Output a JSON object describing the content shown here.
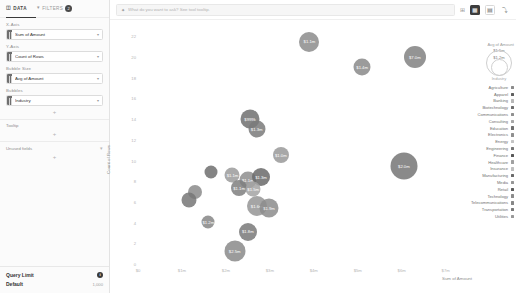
{
  "sidebar": {
    "tabs": [
      {
        "label": "DATA",
        "icon": "database-icon",
        "active": true,
        "badge": ""
      },
      {
        "label": "FILTERS",
        "icon": "funnel-icon",
        "active": false,
        "badge": "2"
      }
    ],
    "shelves": [
      {
        "label": "X-Axis",
        "field": "Sum of Amount",
        "caret": "▾"
      },
      {
        "label": "Y-Axis",
        "field": "Count of Rows",
        "caret": "▾"
      },
      {
        "label": "Bubble Size",
        "field": "Avg of Amount",
        "caret": "▾"
      },
      {
        "label": "Bubbles",
        "field": "Industry",
        "caret": "▾"
      }
    ],
    "add_label": "+",
    "sections": [
      {
        "label": "Tooltip",
        "icon": ""
      },
      {
        "label": "Unused fields",
        "icon": "▾"
      }
    ],
    "query_limit": {
      "title": "Query Limit",
      "info_icon": "i",
      "value": "Default",
      "count": "1,000"
    }
  },
  "topbar": {
    "prompt_icon": "sparkle-icon",
    "prompt_placeholder": "What do you want to ask? See tool tooltip.",
    "buttons": [
      {
        "name": "chart-type-button",
        "icon": "▦",
        "style": "filled"
      },
      {
        "name": "layout-button",
        "icon": "▤",
        "style": "bordered"
      },
      {
        "name": "more-button",
        "icon": "⤵",
        "style": "plain"
      }
    ],
    "settings_icon": "⊞"
  },
  "chart_data": {
    "type": "scatter",
    "title": "",
    "xlabel": "Sum of Amount",
    "ylabel": "Count of Rows",
    "xlim": [
      0,
      7600000
    ],
    "ylim": [
      0,
      23
    ],
    "xticks": [
      {
        "value": 0,
        "label": "$0"
      },
      {
        "value": 1000000,
        "label": "$1m"
      },
      {
        "value": 2000000,
        "label": "$2m"
      },
      {
        "value": 3000000,
        "label": "$3m"
      },
      {
        "value": 4000000,
        "label": "$4m"
      },
      {
        "value": 5000000,
        "label": "$5m"
      },
      {
        "value": 6000000,
        "label": "$6m"
      },
      {
        "value": 7000000,
        "label": "$7m"
      }
    ],
    "yticks": [
      {
        "value": 0,
        "label": "0"
      },
      {
        "value": 2,
        "label": "2"
      },
      {
        "value": 4,
        "label": "4"
      },
      {
        "value": 6,
        "label": "6"
      },
      {
        "value": 8,
        "label": "8"
      },
      {
        "value": 10,
        "label": "10"
      },
      {
        "value": 12,
        "label": "12"
      },
      {
        "value": 14,
        "label": "14"
      },
      {
        "value": 16,
        "label": "16"
      },
      {
        "value": 18,
        "label": "18"
      },
      {
        "value": 20,
        "label": "20"
      },
      {
        "value": 22,
        "label": "22"
      }
    ],
    "grid": false,
    "legend_position": "right",
    "size_field": "Avg of Amount",
    "color_field": "Industry",
    "points": [
      {
        "industry": "Technology",
        "x": 3900000,
        "y": 21.5,
        "size": 20,
        "label": "$1.1m",
        "color": "#8c8c8c"
      },
      {
        "industry": "Manufacturing",
        "x": 5100000,
        "y": 19.0,
        "size": 17,
        "label": "$1.4m",
        "color": "#8a8a8a"
      },
      {
        "industry": "Finance",
        "x": 6300000,
        "y": 20.0,
        "size": 22,
        "label": "$7.0m",
        "color": "#828282"
      },
      {
        "industry": "Healthcare",
        "x": 2550000,
        "y": 14.0,
        "size": 19,
        "label": "$999k",
        "color": "#707070"
      },
      {
        "industry": "Banking",
        "x": 2700000,
        "y": 13.0,
        "size": 17,
        "label": "$1.3m",
        "color": "#7b7b7b"
      },
      {
        "industry": "Consulting",
        "x": 3250000,
        "y": 10.5,
        "size": 16,
        "label": "$1.0m",
        "color": "#9a9a9a"
      },
      {
        "industry": "Energy",
        "x": 6050000,
        "y": 9.5,
        "size": 27,
        "label": "$2.0m",
        "color": "#767676"
      },
      {
        "industry": "Communications",
        "x": 1650000,
        "y": 8.9,
        "size": 13,
        "label": "",
        "color": "#6f6f6f"
      },
      {
        "industry": "Apparel",
        "x": 2150000,
        "y": 8.6,
        "size": 15,
        "label": "$1.1m",
        "color": "#9c9c9c"
      },
      {
        "industry": "Electronics",
        "x": 2500000,
        "y": 8.1,
        "size": 17,
        "label": "$1.1m",
        "color": "#8f8f8f"
      },
      {
        "industry": "Education",
        "x": 2800000,
        "y": 8.4,
        "size": 18,
        "label": "$1.3m",
        "color": "#6b6b6b"
      },
      {
        "industry": "Biotechnology",
        "x": 2300000,
        "y": 7.3,
        "size": 16,
        "label": "$1.1m",
        "color": "#7f7f7f"
      },
      {
        "industry": "Insurance",
        "x": 2620000,
        "y": 7.2,
        "size": 15,
        "label": "$1.5m",
        "color": "#a4a4a4"
      },
      {
        "industry": "Agriculture",
        "x": 1300000,
        "y": 7.0,
        "size": 14,
        "label": "",
        "color": "#8b8b8b"
      },
      {
        "industry": "Engineering",
        "x": 1150000,
        "y": 6.2,
        "size": 15,
        "label": "",
        "color": "#777777"
      },
      {
        "industry": "Media",
        "x": 2700000,
        "y": 5.6,
        "size": 20,
        "label": "$1.6m",
        "color": "#969696"
      },
      {
        "industry": "Retail",
        "x": 2980000,
        "y": 5.4,
        "size": 19,
        "label": "$1.9m",
        "color": "#8d8d8d"
      },
      {
        "industry": "Telecommunications",
        "x": 1600000,
        "y": 4.1,
        "size": 13,
        "label": "$1.2m",
        "color": "#878787"
      },
      {
        "industry": "Transportation",
        "x": 2500000,
        "y": 3.1,
        "size": 18,
        "label": "$1.8m",
        "color": "#7a7a7a"
      },
      {
        "industry": "Utilities",
        "x": 2200000,
        "y": 1.3,
        "size": 21,
        "label": "$2.5m",
        "color": "#8a8a8a"
      }
    ]
  },
  "legend": {
    "size_title": "Avg of Amount",
    "size_caption": "Industry",
    "size_rings": [
      {
        "label": "$1.5m",
        "d": 17
      },
      {
        "label": "$1.2m",
        "d": 26
      }
    ],
    "industries": [
      {
        "name": "Agriculture",
        "color": "#8b8b8b"
      },
      {
        "name": "Apparel",
        "color": "#5f5f5f"
      },
      {
        "name": "Banking",
        "color": "#b8b8b8"
      },
      {
        "name": "Biotechnology",
        "color": "#6e6e6e"
      },
      {
        "name": "Communications",
        "color": "#909090"
      },
      {
        "name": "Consulting",
        "color": "#a8a8a8"
      },
      {
        "name": "Education",
        "color": "#707070"
      },
      {
        "name": "Electronics",
        "color": "#8f8f8f"
      },
      {
        "name": "Energy",
        "color": "#c4c4c4"
      },
      {
        "name": "Engineering",
        "color": "#777777"
      },
      {
        "name": "Finance",
        "color": "#585858"
      },
      {
        "name": "Healthcare",
        "color": "#a0a0a0"
      },
      {
        "name": "Insurance",
        "color": "#bfbfbf"
      },
      {
        "name": "Manufacturing",
        "color": "#6a6a6a"
      },
      {
        "name": "Media",
        "color": "#969696"
      },
      {
        "name": "Retail",
        "color": "#5c5c5c"
      },
      {
        "name": "Technology",
        "color": "#8c8c8c"
      },
      {
        "name": "Telecommunications",
        "color": "#878787"
      },
      {
        "name": "Transportation",
        "color": "#7a7a7a"
      },
      {
        "name": "Utilities",
        "color": "#999999"
      }
    ]
  }
}
